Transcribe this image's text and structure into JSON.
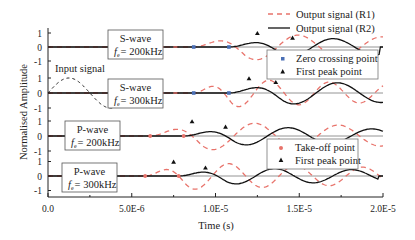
{
  "chart_data": {
    "type": "line",
    "title": "",
    "xlabel": "Time (s)",
    "ylabel": "Normalised Amplitude",
    "xlim": [
      0,
      2e-05
    ],
    "x_ticks": [
      "0.0",
      "5.0E-6",
      "1.0E-5",
      "1.5E-5",
      "2.0E-5"
    ],
    "x_tick_values": [
      0,
      5e-06,
      1e-05,
      1.5e-05,
      2e-05
    ],
    "y_ticks_per_panel": [
      "1",
      "0",
      "-1"
    ],
    "grid": false,
    "legend_top": [
      {
        "label": "Output signal (R1)",
        "style": "dashed",
        "color": "#e8736b"
      },
      {
        "label": "Output signal (R2)",
        "style": "solid",
        "color": "#111111"
      }
    ],
    "legend_s": [
      {
        "label": "Zero crossing point",
        "marker": "square",
        "color": "#4a6fb5"
      },
      {
        "label": "First peak point",
        "marker": "triangle",
        "color": "#111111"
      }
    ],
    "legend_p": [
      {
        "label": "Take-off point",
        "marker": "circle",
        "color": "#e8736b"
      },
      {
        "label": "First peak point",
        "marker": "triangle",
        "color": "#111111"
      }
    ],
    "input_signal": {
      "label": "Input signal",
      "panel": 1,
      "x_start": 0.0,
      "period": 5e-06,
      "cycles": 1
    },
    "panels": [
      {
        "id": "s200",
        "wave": "S-wave",
        "freq_label": "= 200kHz",
        "freq_symbol": "f",
        "freq_sub": "e",
        "R1": {
          "onset": 8.7e-06,
          "period": 5e-06,
          "amp": 1.0,
          "cycles": 2.3,
          "first_peak": 1.25e-05
        },
        "R2": {
          "onset": 1.08e-05,
          "period": 5e-06,
          "amp": 0.7,
          "cycles": 1.8,
          "first_peak": 1.46e-05
        },
        "markers_zero_crossing": [
          8.7e-06,
          1.08e-05
        ]
      },
      {
        "id": "s300",
        "wave": "S-wave",
        "freq_label": "= 300kHz",
        "freq_symbol": "f",
        "freq_sub": "e",
        "R1": {
          "onset": 8.7e-06,
          "period": 3.6e-06,
          "amp": 1.0,
          "cycles": 3.2,
          "first_peak": 1.2e-05
        },
        "R2": {
          "onset": 1.08e-05,
          "period": 5.2e-06,
          "amp": 0.8,
          "cycles": 1.8,
          "first_peak": 1.36e-05
        },
        "markers_zero_crossing": [
          8.7e-06,
          1.08e-05
        ]
      },
      {
        "id": "p200",
        "wave": "P-wave",
        "freq_label": "= 200kHz",
        "freq_symbol": "f",
        "freq_sub": "e",
        "R1": {
          "onset": 6.1e-06,
          "period": 5e-06,
          "amp": 1.0,
          "cycles": 2.8,
          "first_peak": 8.6e-06
        },
        "R2": {
          "onset": 8.1e-06,
          "period": 5e-06,
          "amp": 0.65,
          "cycles": 2.4,
          "first_peak": 1.06e-05
        },
        "markers_takeoff": [
          6.1e-06,
          8.1e-06
        ]
      },
      {
        "id": "p300",
        "wave": "P-wave",
        "freq_label": "= 300kHz",
        "freq_symbol": "f",
        "freq_sub": "e",
        "R1": {
          "onset": 5.8e-06,
          "period": 4e-06,
          "amp": 1.0,
          "cycles": 3.6,
          "first_peak": 7.5e-06
        },
        "R2": {
          "onset": 7.8e-06,
          "period": 4.6e-06,
          "amp": 0.6,
          "cycles": 2.6,
          "first_peak": 9.4e-06
        },
        "markers_takeoff": [
          5.8e-06,
          7.8e-06
        ]
      }
    ]
  }
}
